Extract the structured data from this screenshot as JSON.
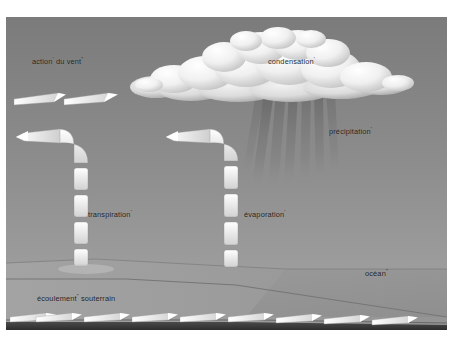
{
  "diagram": {
    "language": "fr",
    "background_color": "#8a8a8a",
    "frame_color": "#ffffff"
  },
  "labels": {
    "wind": {
      "text": "action",
      "sup": "'",
      "text2": " du vent",
      "sup2": "\"",
      "x": 32,
      "y": 58
    },
    "condensation": {
      "text": "condensation",
      "sup": "'",
      "x": 268,
      "y": 58
    },
    "precipitation": {
      "text": "précipitation",
      "sup": "'",
      "x": 329,
      "y": 128
    },
    "transpiration": {
      "text": "transpiration",
      "sup": "'",
      "x": 88,
      "y": 211
    },
    "evaporation": {
      "text": "évaporation",
      "sup": "'",
      "x": 244,
      "y": 211
    },
    "ocean": {
      "text": "océan",
      "sup": "\"",
      "x": 365,
      "y": 270
    },
    "groundwater": {
      "text": "écoulement",
      "sup": "\"",
      "text2": " souterrain",
      "x": 37,
      "y": 295
    }
  },
  "colors": {
    "sky_top": "#7e7e7e",
    "sky_bottom": "#a2a2a2",
    "cloud_light": "#f4f4f4",
    "cloud_shadow": "#b9b9b9",
    "rain": "#6e6e6e",
    "ground": "#9b9b9b",
    "ocean": "#8f8f8f",
    "bedrock": "#3a3a3a",
    "arrow_fill": "#f2f2f2",
    "arrow_shadow": "#6f6f6f"
  },
  "elements": {
    "cloud_name": "cumulus-cloud",
    "rain_name": "rain-streaks",
    "wind_arrows_count": 2,
    "transpiration_segments": 4,
    "evaporation_segments": 4,
    "groundwater_arrows_count": 9
  }
}
